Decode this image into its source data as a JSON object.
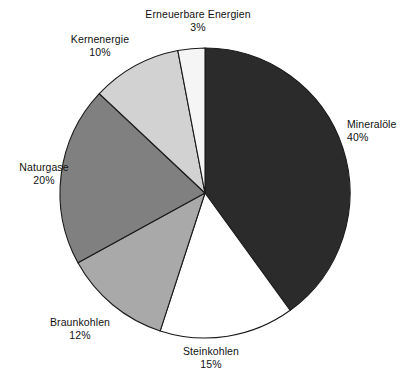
{
  "chart_data": {
    "type": "pie",
    "title": "",
    "subtitle": "",
    "xlabel": "",
    "ylabel": "",
    "legend_position": "none",
    "grid": false,
    "start_angle_deg": 0,
    "direction": "clockwise",
    "unit": "%",
    "categories": [
      "Mineralöle",
      "Steinkohlen",
      "Braunkohlen",
      "Naturgase",
      "Kernenergie",
      "Erneuerbare Energien"
    ],
    "values": [
      40,
      15,
      12,
      20,
      10,
      3
    ],
    "slices": [
      {
        "key": "mineraloele",
        "label": "Mineralöle",
        "value": 40,
        "percent_text": "40%",
        "color": "#2b2b2b"
      },
      {
        "key": "steinkohlen",
        "label": "Steinkohlen",
        "value": 15,
        "percent_text": "15%",
        "color": "#ffffff"
      },
      {
        "key": "braunkohlen",
        "label": "Braunkohlen",
        "value": 12,
        "percent_text": "12%",
        "color": "#a9a9a9"
      },
      {
        "key": "naturgase",
        "label": "Naturgase",
        "value": 20,
        "percent_text": "20%",
        "color": "#808080"
      },
      {
        "key": "kernenergie",
        "label": "Kernenergie",
        "value": 10,
        "percent_text": "10%",
        "color": "#d2d2d2"
      },
      {
        "key": "erneuerbare",
        "label": "Erneuerbare Energien",
        "value": 3,
        "percent_text": "3%",
        "color": "#f5f5f5"
      }
    ],
    "outline_color": "#1a1a1a",
    "background_color": "#ffffff"
  }
}
